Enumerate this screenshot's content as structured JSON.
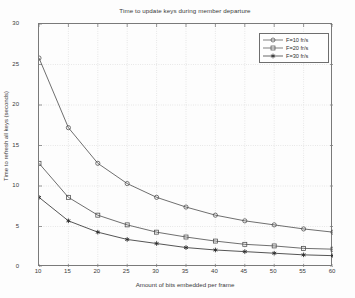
{
  "chart_data": {
    "type": "line",
    "title": "Time to update keys during member departure",
    "xlabel": "Amount of bits embedded per frame",
    "ylabel": "Time to refresh all keys (seconds)",
    "x": [
      10,
      15,
      20,
      25,
      30,
      35,
      40,
      45,
      50,
      55,
      60
    ],
    "xlim": [
      10,
      60
    ],
    "ylim": [
      0,
      30
    ],
    "xticks": [
      10,
      15,
      20,
      25,
      30,
      35,
      40,
      45,
      50,
      55,
      60
    ],
    "yticks": [
      0,
      5,
      10,
      15,
      20,
      25,
      30
    ],
    "grid": true,
    "legend_position": "upper-right",
    "series": [
      {
        "name": "F=10 fr/s",
        "marker": "circle",
        "color": "#4a4a4a",
        "values": [
          25.8,
          17.2,
          12.8,
          10.3,
          8.6,
          7.4,
          6.4,
          5.7,
          5.2,
          4.7,
          4.3
        ]
      },
      {
        "name": "F=20 fr/s",
        "marker": "square",
        "color": "#4a4a4a",
        "values": [
          12.8,
          8.6,
          6.4,
          5.2,
          4.3,
          3.7,
          3.2,
          2.8,
          2.6,
          2.3,
          2.2
        ]
      },
      {
        "name": "F=30 fr/s",
        "marker": "star",
        "color": "#2a2a2a",
        "values": [
          8.6,
          5.7,
          4.3,
          3.4,
          2.9,
          2.4,
          2.1,
          1.9,
          1.7,
          1.5,
          1.4
        ]
      }
    ]
  },
  "legend": {
    "items": [
      {
        "label": "F=10 fr/s"
      },
      {
        "label": "F=20 fr/s"
      },
      {
        "label": "F=30 fr/s"
      }
    ]
  },
  "axes": {
    "x_tick_labels": [
      "10",
      "15",
      "20",
      "25",
      "30",
      "35",
      "40",
      "45",
      "50",
      "55",
      "60"
    ],
    "y_tick_labels": [
      "0",
      "5",
      "10",
      "15",
      "20",
      "25",
      "30"
    ]
  }
}
